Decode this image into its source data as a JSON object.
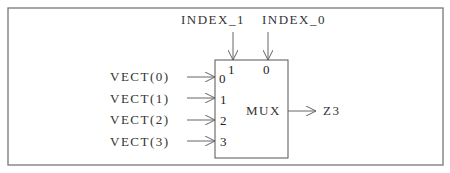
{
  "diagram": {
    "type": "multiplexer-block",
    "block_label": "MUX",
    "select_inputs": [
      {
        "label": "INDEX_1",
        "pin": "1"
      },
      {
        "label": "INDEX_0",
        "pin": "0"
      }
    ],
    "data_inputs": [
      {
        "label": "VECT(0)",
        "pin": "0"
      },
      {
        "label": "VECT(1)",
        "pin": "1"
      },
      {
        "label": "VECT(2)",
        "pin": "2"
      },
      {
        "label": "VECT(3)",
        "pin": "3"
      }
    ],
    "output": {
      "label": "Z3"
    },
    "colors": {
      "line": "#666666",
      "text": "#333333",
      "background": "#ffffff"
    }
  }
}
